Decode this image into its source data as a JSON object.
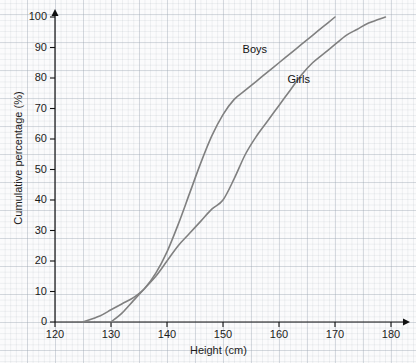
{
  "chart_data": {
    "type": "line",
    "title": "",
    "xlabel": "Height (cm)",
    "ylabel": "Cumulative percentage (%)",
    "xlim": [
      120,
      180
    ],
    "ylim": [
      0,
      100
    ],
    "xticks": [
      120,
      130,
      140,
      150,
      160,
      170,
      180
    ],
    "yticks": [
      0,
      10,
      20,
      30,
      40,
      50,
      60,
      70,
      80,
      90,
      100
    ],
    "grid": true,
    "legend_position": "inline-annotations",
    "series": [
      {
        "name": "Boys",
        "color": "#808080",
        "x": [
          125,
          128,
          130,
          132,
          134,
          136,
          138,
          140,
          142,
          144,
          146,
          148,
          150,
          152,
          154,
          156,
          158,
          160,
          162,
          164,
          166,
          168,
          170
        ],
        "values": [
          0,
          2,
          4,
          6,
          8,
          11,
          16,
          23,
          32,
          42,
          52,
          61,
          68,
          73,
          76,
          79,
          82,
          85,
          88,
          91,
          94,
          97,
          100
        ]
      },
      {
        "name": "Girls",
        "color": "#808080",
        "x": [
          130,
          132,
          134,
          136,
          138,
          140,
          142,
          144,
          146,
          148,
          150,
          152,
          154,
          156,
          158,
          160,
          162,
          164,
          166,
          168,
          170,
          172,
          174,
          176,
          179
        ],
        "values": [
          0,
          3,
          7,
          11,
          15,
          20,
          25,
          29,
          33,
          37,
          40,
          47,
          55,
          61,
          66,
          71,
          76,
          81,
          85,
          88,
          91,
          94,
          96,
          98,
          100
        ]
      }
    ],
    "annotations": [
      {
        "text": "Boys",
        "x": 153.5,
        "y": 89
      },
      {
        "text": "Girls",
        "x": 161.5,
        "y": 79
      }
    ]
  }
}
